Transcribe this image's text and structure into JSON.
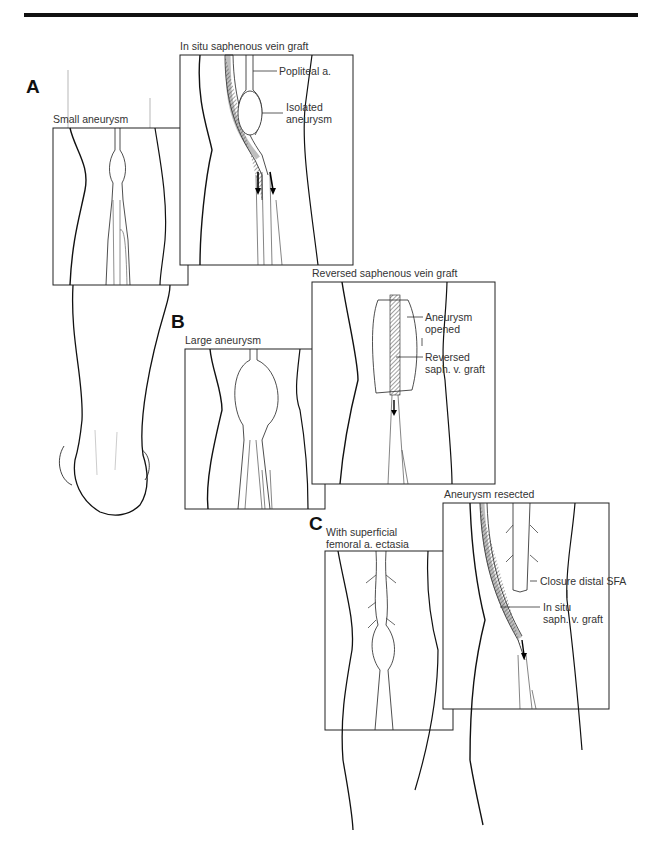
{
  "figure": {
    "panels": [
      {
        "letter": "A",
        "left": {
          "caption": "Small aneurysm"
        },
        "right": {
          "caption": "In situ saphenous vein graft",
          "labels": [
            "Popliteal a.",
            "Isolated",
            "aneurysm"
          ]
        }
      },
      {
        "letter": "B",
        "left": {
          "caption": "Large aneurysm"
        },
        "right": {
          "caption": "Reversed saphenous vein graft",
          "labels": [
            "Aneurysm",
            "opened",
            "Reversed",
            "saph. v. graft"
          ]
        }
      },
      {
        "letter": "C",
        "left": {
          "caption_line1": "With superficial",
          "caption_line2": "femoral a. ectasia"
        },
        "right": {
          "caption": "Aneurysm resected",
          "labels": [
            "Closure distal SFA",
            "In situ",
            "saph. v. graft"
          ]
        }
      }
    ]
  }
}
